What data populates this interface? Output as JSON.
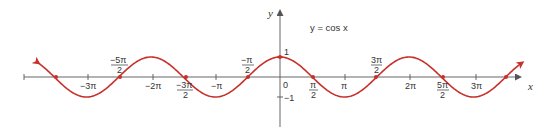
{
  "chart_data": {
    "type": "line",
    "title": "y = cos x",
    "xlabel": "x",
    "ylabel": "y",
    "function": "cos",
    "xlim_pi": [
      -3.75,
      3.75
    ],
    "ylim": [
      -1.2,
      1.2
    ],
    "grid": false,
    "legend": null,
    "annotation": "y = cos x",
    "x_ticks": [
      "-3π",
      "-2π",
      "-π",
      "0",
      "π",
      "2π",
      "3π"
    ],
    "x_zero_labels": [
      "-5π/2",
      "-3π/2",
      "-π/2",
      "π/2",
      "3π/2",
      "5π/2"
    ],
    "y_ticks": [
      "1",
      "-1"
    ],
    "marked_points": [
      {
        "x": "-7π/2",
        "y": 0
      },
      {
        "x": "-5π/2",
        "y": 0
      },
      {
        "x": "-3π/2",
        "y": 0
      },
      {
        "x": "-π/2",
        "y": 0
      },
      {
        "x": "0",
        "y": 1
      },
      {
        "x": "π/2",
        "y": 0
      },
      {
        "x": "3π/2",
        "y": 0
      },
      {
        "x": "5π/2",
        "y": 0
      },
      {
        "x": "7π/2",
        "y": 0
      }
    ],
    "series": [
      {
        "name": "cos x",
        "color": "#c8302a",
        "arrows_both_ends": true
      }
    ]
  },
  "labels": {
    "y_axis": "y",
    "x_axis": "x",
    "equation": "y = cos  x",
    "origin": "0",
    "one": "1",
    "neg_one": "−1",
    "neg3pi": "−3π",
    "neg2pi": "−2π",
    "negpi": "−π",
    "pi": "π",
    "twopi": "2π",
    "threepi": "3π",
    "neg5pi_num": "−5π",
    "neg3pi_num": "−3π",
    "negpi_num": "−π",
    "pi_num": "π",
    "threepi_num": "3π",
    "fivepi_num": "5π",
    "den": "2"
  },
  "colors": {
    "curve": "#c8302a",
    "axis": "#555555",
    "text": "#333333"
  }
}
